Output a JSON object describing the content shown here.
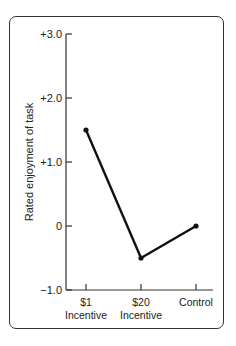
{
  "chart_data": {
    "type": "line",
    "title": "",
    "xlabel": "",
    "ylabel": "Rated enjoyment of task",
    "categories": [
      [
        "$1",
        "Incentive"
      ],
      [
        "$20",
        "Incentive"
      ],
      [
        "Control"
      ]
    ],
    "series": [
      {
        "name": "Rated enjoyment",
        "values": [
          1.5,
          -0.5,
          0.0
        ]
      }
    ],
    "ylim": [
      -1.0,
      3.0
    ],
    "yticks": [
      3.0,
      2.0,
      1.0,
      0,
      -1.0
    ],
    "ytick_labels": [
      "+3.0",
      "+2.0",
      "+1.0",
      "0",
      "−1.0"
    ],
    "grid": false,
    "legend": null,
    "colors": {
      "line": "#111111",
      "axis": "#333333",
      "frame": "#333333"
    }
  }
}
